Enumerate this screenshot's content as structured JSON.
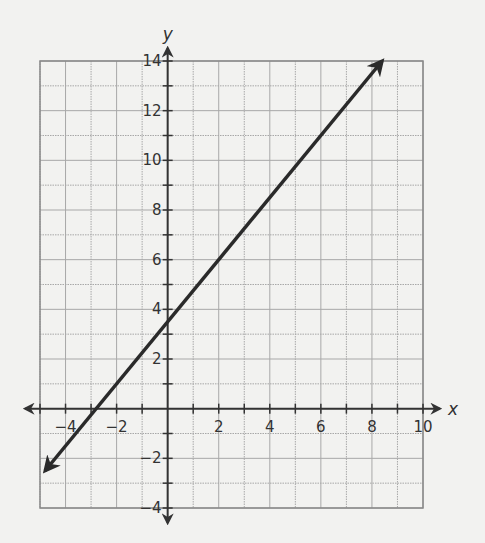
{
  "chart_data": {
    "type": "line",
    "title": "",
    "xlabel": "x",
    "ylabel": "y",
    "xlim": [
      -5,
      10
    ],
    "ylim": [
      -4,
      14
    ],
    "grid": true,
    "x_ticks_labeled": [
      -4,
      -2,
      2,
      4,
      6,
      8,
      10
    ],
    "y_ticks_labeled": [
      -4,
      -2,
      2,
      4,
      6,
      8,
      10,
      12,
      14
    ],
    "x_tick_labels": [
      "−4",
      "−2",
      "2",
      "4",
      "6",
      "8",
      "10"
    ],
    "y_tick_labels": [
      "−4",
      "−2",
      "2",
      "4",
      "6",
      "8",
      "10",
      "12",
      "14"
    ],
    "series": [
      {
        "name": "line",
        "equation": "y = 1.25x + 3.5",
        "x": [
          -4.8,
          -2.8,
          0,
          6,
          8.4
        ],
        "y": [
          -2.5,
          0,
          3.5,
          11,
          14
        ],
        "arrows": "both ends",
        "color": "#2a2a2a"
      }
    ],
    "legend": "none"
  },
  "colors": {
    "background": "#f2f2f0",
    "grid": "#a8a8a8",
    "axis": "#333333",
    "line": "#2a2a2a"
  }
}
